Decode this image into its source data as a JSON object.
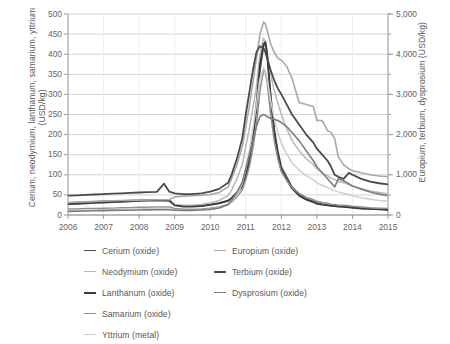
{
  "chart_data": {
    "type": "line",
    "title": "",
    "xlabel": "",
    "ylabel": "Cerium, neodymium, lanthanum, samarium, yttrium (USD/kg)",
    "y2label": "Europium, terbium, dysprosium (USD/kg)",
    "xlim": [
      2006,
      2015
    ],
    "ylim": [
      0,
      500
    ],
    "y2lim": [
      0,
      5000
    ],
    "grid": true,
    "legend_position": "bottom",
    "x_ticks": [
      "2006",
      "2007",
      "2008",
      "2009",
      "2010",
      "2011",
      "2012",
      "2013",
      "2014",
      "2015"
    ],
    "y_ticks": [
      "0",
      "50",
      "100",
      "150",
      "200",
      "250",
      "300",
      "350",
      "400",
      "450",
      "500"
    ],
    "y2_ticks": [
      "0",
      "1,000",
      "2,000",
      "3,000",
      "4,000",
      "5,000"
    ],
    "x": [
      2006.0,
      2006.25,
      2006.5,
      2006.75,
      2007.0,
      2007.25,
      2007.5,
      2007.75,
      2008.0,
      2008.25,
      2008.5,
      2008.7,
      2008.85,
      2009.0,
      2009.25,
      2009.5,
      2009.75,
      2010.0,
      2010.25,
      2010.5,
      2010.6,
      2010.75,
      2010.9,
      2011.0,
      2011.1,
      2011.2,
      2011.3,
      2011.4,
      2011.5,
      2011.55,
      2011.6,
      2011.7,
      2011.8,
      2011.9,
      2012.0,
      2012.15,
      2012.3,
      2012.5,
      2012.7,
      2012.9,
      2013.0,
      2013.15,
      2013.3,
      2013.4,
      2013.5,
      2013.6,
      2013.75,
      2013.9,
      2014.0,
      2014.25,
      2014.5,
      2014.75,
      2015.0
    ],
    "series": [
      {
        "name": "Cerium (oxide)",
        "axis": "left",
        "color": "#4a4a4a",
        "width": 1.5,
        "values": [
          30,
          31,
          32,
          33,
          34,
          34,
          35,
          36,
          37,
          38,
          38,
          38,
          38,
          25,
          22,
          22,
          23,
          26,
          30,
          36,
          42,
          55,
          70,
          95,
          130,
          185,
          260,
          360,
          420,
          430,
          405,
          300,
          215,
          160,
          120,
          95,
          70,
          52,
          40,
          34,
          30,
          27,
          25,
          24,
          23,
          22,
          21,
          20,
          19,
          17,
          15,
          14,
          13
        ]
      },
      {
        "name": "Neodymium (oxide)",
        "axis": "left",
        "color": "#b8b8b8",
        "width": 1.5,
        "values": [
          28,
          29,
          30,
          31,
          32,
          33,
          34,
          35,
          36,
          37,
          37,
          37,
          36,
          26,
          24,
          24,
          26,
          30,
          36,
          48,
          62,
          90,
          125,
          170,
          215,
          265,
          320,
          400,
          440,
          430,
          400,
          350,
          310,
          280,
          250,
          215,
          185,
          160,
          140,
          125,
          115,
          105,
          98,
          92,
          88,
          84,
          80,
          76,
          72,
          66,
          60,
          56,
          53
        ]
      },
      {
        "name": "Lanthanum (oxide)",
        "axis": "left",
        "color": "#3c3c3c",
        "width": 1.8,
        "values": [
          27,
          28,
          29,
          30,
          31,
          32,
          33,
          34,
          35,
          36,
          36,
          36,
          35,
          24,
          21,
          21,
          22,
          25,
          29,
          35,
          42,
          56,
          74,
          100,
          140,
          195,
          275,
          375,
          425,
          430,
          400,
          290,
          205,
          150,
          112,
          88,
          66,
          48,
          38,
          32,
          28,
          26,
          24,
          23,
          22,
          21,
          20,
          19,
          18,
          16,
          15,
          14,
          13
        ]
      },
      {
        "name": "Samarium (oxide)",
        "axis": "left",
        "color": "#8f8f8f",
        "width": 1.5,
        "values": [
          15,
          15,
          16,
          16,
          17,
          17,
          18,
          18,
          19,
          19,
          20,
          20,
          20,
          16,
          14,
          14,
          15,
          17,
          20,
          26,
          32,
          45,
          62,
          88,
          120,
          165,
          225,
          310,
          360,
          355,
          330,
          250,
          185,
          140,
          108,
          86,
          68,
          54,
          44,
          38,
          34,
          31,
          29,
          27,
          26,
          25,
          24,
          23,
          22,
          20,
          18,
          17,
          16
        ]
      },
      {
        "name": "Yttrium (metal)",
        "axis": "left",
        "color": "#cfcfcf",
        "width": 1.5,
        "values": [
          12,
          12,
          12,
          13,
          13,
          14,
          14,
          15,
          15,
          16,
          16,
          16,
          16,
          13,
          12,
          12,
          13,
          15,
          18,
          24,
          32,
          50,
          78,
          115,
          160,
          215,
          275,
          340,
          365,
          358,
          340,
          285,
          240,
          205,
          178,
          152,
          130,
          112,
          98,
          88,
          80,
          74,
          68,
          64,
          60,
          57,
          54,
          51,
          48,
          43,
          39,
          36,
          34
        ]
      },
      {
        "name": "Europium (oxide)",
        "axis": "right",
        "color": "#a8a8a8",
        "width": 1.6,
        "values": [
          310,
          320,
          330,
          340,
          350,
          355,
          360,
          365,
          370,
          375,
          380,
          380,
          380,
          450,
          470,
          480,
          490,
          510,
          560,
          700,
          900,
          1250,
          1700,
          2200,
          2700,
          3300,
          3900,
          4500,
          4800,
          4750,
          4600,
          4250,
          4050,
          3900,
          3850,
          3700,
          3400,
          2800,
          2750,
          2700,
          2350,
          2350,
          2100,
          2050,
          1900,
          1450,
          1250,
          1150,
          1100,
          1050,
          1000,
          970,
          950
        ]
      },
      {
        "name": "Terbium (oxide)",
        "axis": "right",
        "color": "#4a4a4a",
        "width": 1.8,
        "values": [
          480,
          490,
          500,
          510,
          520,
          530,
          540,
          550,
          560,
          570,
          575,
          780,
          580,
          540,
          520,
          520,
          540,
          580,
          650,
          800,
          1000,
          1400,
          1900,
          2500,
          3050,
          3600,
          4050,
          4200,
          4150,
          4050,
          3900,
          3600,
          3350,
          3150,
          3000,
          2750,
          2500,
          2250,
          2000,
          1800,
          1650,
          1500,
          1350,
          1200,
          1000,
          950,
          900,
          1050,
          1000,
          900,
          830,
          790,
          760
        ]
      },
      {
        "name": "Dysprosium (oxide)",
        "axis": "right",
        "color": "#7d7d7d",
        "width": 1.6,
        "values": [
          90,
          95,
          100,
          105,
          110,
          115,
          118,
          120,
          125,
          128,
          130,
          130,
          130,
          120,
          115,
          115,
          125,
          140,
          175,
          260,
          360,
          560,
          820,
          1150,
          1500,
          1850,
          2200,
          2450,
          2500,
          2480,
          2450,
          2400,
          2380,
          2350,
          2300,
          2200,
          2050,
          1850,
          1600,
          1350,
          1200,
          1050,
          900,
          800,
          700,
          900,
          850,
          780,
          720,
          640,
          570,
          520,
          480
        ]
      }
    ]
  },
  "legend": {
    "left_column": [
      {
        "label": "Cerium (oxide)",
        "color": "#4a4a4a",
        "width": 1.8
      },
      {
        "label": "Neodymium (oxide)",
        "color": "#b8b8b8",
        "width": 1.6
      },
      {
        "label": "Lanthanum (oxide)",
        "color": "#3c3c3c",
        "width": 2.2
      },
      {
        "label": "Samarium (oxide)",
        "color": "#8f8f8f",
        "width": 1.6
      },
      {
        "label": "Yttrium (metal)",
        "color": "#cfcfcf",
        "width": 1.6
      }
    ],
    "right_column": [
      {
        "label": "Europium (oxide)",
        "color": "#a8a8a8",
        "width": 1.6
      },
      {
        "label": "Terbium (oxide)",
        "color": "#4a4a4a",
        "width": 2.4
      },
      {
        "label": "Dysprosium (oxide)",
        "color": "#7d7d7d",
        "width": 1.8
      }
    ]
  },
  "style": {
    "grid_color": "#d4d4d4",
    "axis_color": "#9a9a9a",
    "text_color": "#595959",
    "background": "#ffffff"
  }
}
